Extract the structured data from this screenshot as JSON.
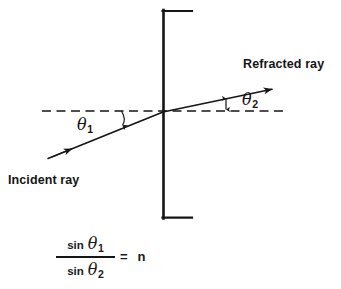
{
  "diagram": {
    "title_text_present": false,
    "labels": {
      "refracted_ray": "Refracted ray",
      "incident_ray": "Incident ray",
      "theta1_symbol": "θ",
      "theta1_subscript": "1",
      "theta2_symbol": "θ",
      "theta2_subscript": "2"
    },
    "formula": {
      "numerator_function": "sin",
      "numerator_symbol": "θ",
      "numerator_subscript": "1",
      "denominator_function": "sin",
      "denominator_symbol": "θ",
      "denominator_subscript": "2",
      "equals": "=",
      "result": "n"
    },
    "colors": {
      "ink": "#151515",
      "background": "#ffffff"
    },
    "geometry": {
      "interface_x": 163,
      "interface_top_y": 10,
      "interface_bottom_y": 218,
      "interface_tick_right_x": 192,
      "normal_line_y": 111,
      "normal_line_start_x": 42,
      "normal_line_end_x": 283,
      "incident_ray_start": [
        48,
        158
      ],
      "incident_ray_end": [
        163,
        112
      ],
      "refracted_ray_start": [
        163,
        112
      ],
      "refracted_ray_end": [
        279,
        87
      ]
    }
  }
}
